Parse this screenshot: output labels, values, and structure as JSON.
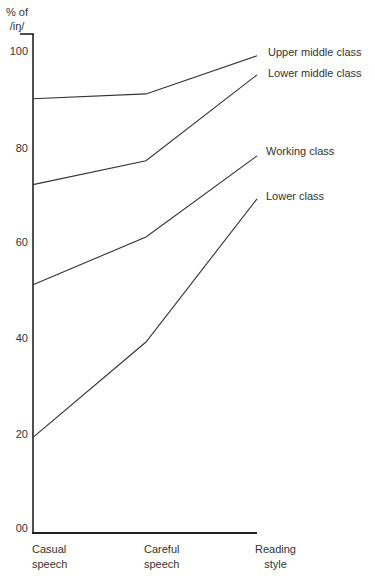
{
  "chart_data": {
    "type": "line",
    "title": "",
    "xlabel": "",
    "ylabel": "% of /iŋ/",
    "ylabel_lines": [
      "% of",
      "/iŋ/"
    ],
    "categories": [
      "Casual speech",
      "Careful speech",
      "Reading style"
    ],
    "category_lines": [
      [
        "Casual",
        "speech"
      ],
      [
        "Careful",
        "speech"
      ],
      [
        "Reading",
        "style"
      ]
    ],
    "yticks": [
      "100",
      "80",
      "60",
      "40",
      "20",
      "00"
    ],
    "ytick_values": [
      100,
      80,
      60,
      40,
      20,
      0
    ],
    "ylim": [
      0,
      100
    ],
    "grid": false,
    "legend_position": "inline-right",
    "series": [
      {
        "name": "Upper middle class",
        "values": [
          90,
          91,
          99
        ]
      },
      {
        "name": "Lower middle class",
        "values": [
          72,
          77,
          95
        ]
      },
      {
        "name": "Working class",
        "values": [
          51,
          61,
          78
        ]
      },
      {
        "name": "Lower class",
        "values": [
          19,
          39,
          69
        ]
      }
    ]
  },
  "colors": {
    "line": "#333333",
    "axis": "#222222",
    "text": "#333333"
  }
}
